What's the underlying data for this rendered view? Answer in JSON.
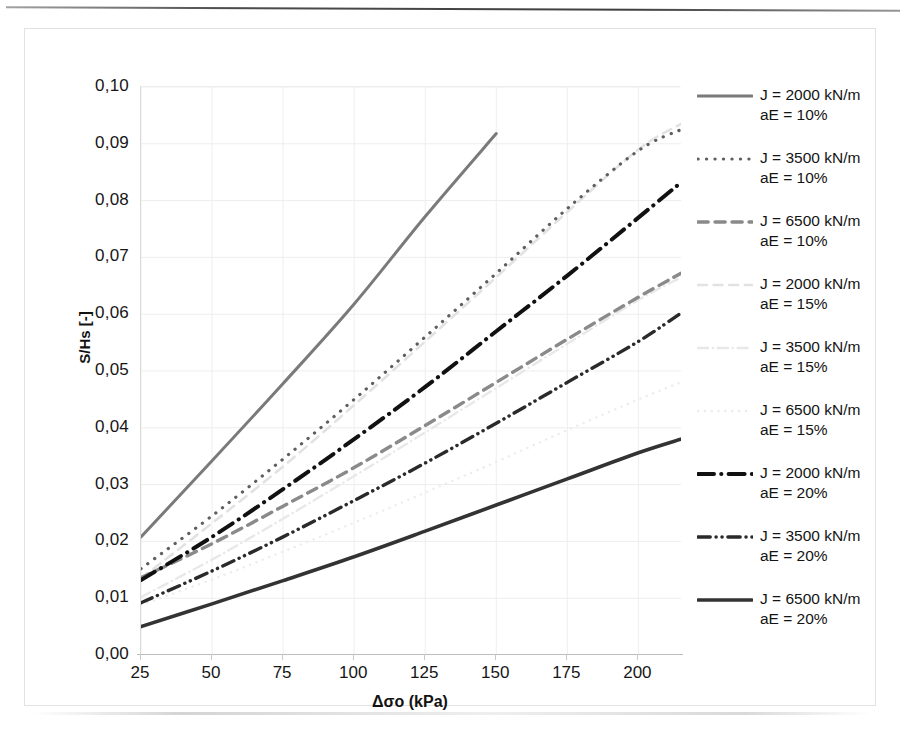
{
  "chart_data": {
    "type": "line",
    "title": "",
    "xlabel": "Δσo (kPa)",
    "ylabel": "S/Hs [-]",
    "xlim": [
      25,
      215
    ],
    "ylim": [
      0.0,
      0.1
    ],
    "grid": true,
    "legend_position": "right",
    "xticks": [
      "25",
      "50",
      "75",
      "100",
      "125",
      "150",
      "175",
      "200"
    ],
    "xtick_values": [
      25,
      50,
      75,
      100,
      125,
      150,
      175,
      200
    ],
    "yticks": [
      "0,00",
      "0,01",
      "0,02",
      "0,03",
      "0,04",
      "0,05",
      "0,06",
      "0,07",
      "0,08",
      "0,09",
      "0,10"
    ],
    "ytick_values": [
      0.0,
      0.01,
      0.02,
      0.03,
      0.04,
      0.05,
      0.06,
      0.07,
      0.08,
      0.09,
      0.1
    ],
    "series": [
      {
        "name": "J = 2000 kN/m aE = 10%",
        "label_line1": "J = 2000 kN/m",
        "label_line2": "aE = 10%",
        "style": "solid",
        "color": "#7a7a7a",
        "width": 3.0,
        "x": [
          25,
          50,
          75,
          100,
          125,
          150
        ],
        "y": [
          0.0208,
          0.0342,
          0.0478,
          0.0618,
          0.0772,
          0.0918
        ]
      },
      {
        "name": "J = 3500 kN/m aE = 10%",
        "label_line1": "J = 3500 kN/m",
        "label_line2": "aE = 10%",
        "style": "dotted",
        "color": "#5e5e5e",
        "width": 3.2,
        "x": [
          25,
          50,
          75,
          100,
          125,
          150,
          175,
          200,
          215
        ],
        "y": [
          0.0152,
          0.0245,
          0.0345,
          0.045,
          0.056,
          0.0672,
          0.0786,
          0.0888,
          0.0925
        ]
      },
      {
        "name": "J = 6500 kN/m aE = 10%",
        "label_line1": "J = 6500 kN/m",
        "label_line2": "aE = 10%",
        "style": "dashed",
        "color": "#8a8a8a",
        "width": 3.4,
        "x": [
          25,
          50,
          75,
          100,
          125,
          150,
          175,
          200,
          215
        ],
        "y": [
          0.0136,
          0.0196,
          0.0262,
          0.033,
          0.0404,
          0.048,
          0.0556,
          0.063,
          0.0672
        ]
      },
      {
        "name": "J = 2000 kN/m aE = 15%",
        "label_line1": "J = 2000 kN/m",
        "label_line2": "aE = 15%",
        "style": "dashed-faint",
        "color": "#e2e2e2",
        "width": 2.6,
        "x": [
          25,
          50,
          75,
          100,
          125,
          150,
          175,
          200,
          215
        ],
        "y": [
          0.0135,
          0.0232,
          0.0332,
          0.044,
          0.0552,
          0.0665,
          0.078,
          0.089,
          0.0935
        ]
      },
      {
        "name": "J = 3500 kN/m aE = 15%",
        "label_line1": "J = 3500 kN/m",
        "label_line2": "aE = 15%",
        "style": "dashdot-faint",
        "color": "#e8e8e8",
        "width": 2.4,
        "x": [
          25,
          50,
          75,
          100,
          125,
          150,
          175,
          200,
          215
        ],
        "y": [
          0.0102,
          0.0168,
          0.024,
          0.0315,
          0.0392,
          0.047,
          0.0548,
          0.0625,
          0.0665
        ]
      },
      {
        "name": "J = 6500 kN/m aE = 15%",
        "label_line1": "J = 6500 kN/m",
        "label_line2": "aE = 15%",
        "style": "dotted-faint",
        "color": "#ececec",
        "width": 2.4,
        "x": [
          25,
          50,
          75,
          100,
          125,
          150,
          175,
          200,
          215
        ],
        "y": [
          0.0088,
          0.0133,
          0.0182,
          0.0233,
          0.0286,
          0.034,
          0.0396,
          0.045,
          0.048
        ]
      },
      {
        "name": "J = 2000 kN/m aE = 20%",
        "label_line1": "J = 2000 kN/m",
        "label_line2": "aE = 20%",
        "style": "dashdot-bold",
        "color": "#111111",
        "width": 4.0,
        "x": [
          25,
          50,
          75,
          100,
          125,
          150,
          175,
          200,
          215
        ],
        "y": [
          0.0132,
          0.0208,
          0.0292,
          0.038,
          0.0472,
          0.057,
          0.0668,
          0.077,
          0.0832
        ]
      },
      {
        "name": "J = 3500 kN/m aE = 20%",
        "label_line1": "J = 3500 kN/m",
        "label_line2": "aE = 20%",
        "style": "dashdotdot-bold",
        "color": "#2a2a2a",
        "width": 3.4,
        "x": [
          25,
          50,
          75,
          100,
          125,
          150,
          175,
          200,
          215
        ],
        "y": [
          0.0092,
          0.0148,
          0.0208,
          0.0272,
          0.0338,
          0.0408,
          0.048,
          0.0552,
          0.0602
        ]
      },
      {
        "name": "J = 6500 kN/m aE = 20%",
        "label_line1": "J = 6500 kN/m",
        "label_line2": "aE = 20%",
        "style": "solid-bold",
        "color": "#333333",
        "width": 3.6,
        "x": [
          25,
          50,
          75,
          100,
          125,
          150,
          175,
          200,
          215
        ],
        "y": [
          0.005,
          0.009,
          0.0131,
          0.0173,
          0.0218,
          0.0264,
          0.031,
          0.0356,
          0.038
        ]
      }
    ]
  },
  "axes": {
    "x_title": "Δσo (kPa)",
    "y_title": "S/Hs [-]"
  },
  "legend": {
    "items": [
      {
        "line1": "J = 2000 kN/m",
        "line2": "aE = 10%"
      },
      {
        "line1": "J = 3500 kN/m",
        "line2": "aE = 10%"
      },
      {
        "line1": "J = 6500 kN/m",
        "line2": "aE = 10%"
      },
      {
        "line1": "J = 2000 kN/m",
        "line2": "aE = 15%"
      },
      {
        "line1": "J = 3500 kN/m",
        "line2": "aE = 15%"
      },
      {
        "line1": "J = 6500 kN/m",
        "line2": "aE = 15%"
      },
      {
        "line1": "J = 2000 kN/m",
        "line2": "aE = 20%"
      },
      {
        "line1": "J = 3500 kN/m",
        "line2": "aE = 20%"
      },
      {
        "line1": "J = 6500 kN/m",
        "line2": "aE = 20%"
      }
    ]
  }
}
